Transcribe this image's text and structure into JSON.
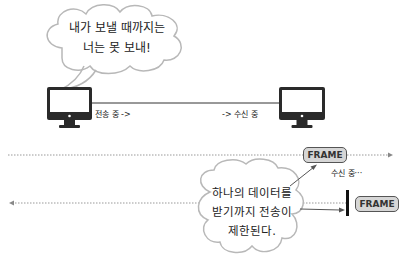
{
  "top_scene": {
    "cloud_text": [
      "내가 보낼 때까지는",
      "너는 못 보내!"
    ],
    "left_label": "전송 중 ->",
    "right_label": "-> 수신 중",
    "left_device": "monitor-icon",
    "right_device": "monitor-icon"
  },
  "bottom_scene": {
    "upper_frame_label": "FRAME",
    "receiving_label": "수신 중···",
    "lower_frame_label": "FRAME",
    "cloud_text": [
      "하나의 데이터를",
      "받기까지 전송이",
      "제한된다."
    ]
  },
  "colors": {
    "line": "#333333",
    "dotted_line": "#999999",
    "cloud_stroke": "#b8b8b8",
    "frame_fill": "#d6d6d6",
    "frame_border": "#555555",
    "monitor": "#2a2a2a"
  }
}
